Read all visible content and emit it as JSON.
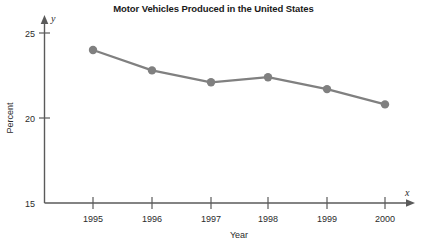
{
  "chart_data": {
    "type": "line",
    "title": "Motor Vehicles Produced in the United States",
    "xlabel": "Year",
    "ylabel": "Percent",
    "x_axis_variable": "x",
    "y_axis_variable": "y",
    "categories": [
      "1995",
      "1996",
      "1997",
      "1998",
      "1999",
      "2000"
    ],
    "values": [
      24.0,
      22.8,
      22.1,
      22.4,
      21.7,
      20.8
    ],
    "series": [
      {
        "name": "Percent",
        "values": [
          24.0,
          22.8,
          22.1,
          22.4,
          21.7,
          20.8
        ]
      }
    ],
    "ylim": [
      15,
      25
    ],
    "y_ticks": [
      "25",
      "20",
      "15"
    ],
    "y_tick_values": [
      25,
      20,
      15
    ],
    "grid": false,
    "legend": "none",
    "marker": "circle",
    "series_color": "#808080",
    "axis_color": "#5a5a5a",
    "text_color": "#2b2b2b"
  }
}
